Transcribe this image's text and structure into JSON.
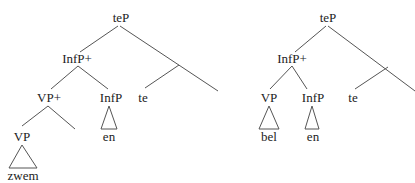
{
  "trees": [
    {
      "name": "left-tree",
      "nodes": {
        "root": "teP",
        "infp_plus": "InfP+",
        "vp_plus": "VP+",
        "infp": "InfP",
        "te": "te",
        "vp": "VP",
        "infp_leaf": "en",
        "vp_leaf": "zwem"
      }
    },
    {
      "name": "right-tree",
      "nodes": {
        "root": "teP",
        "infp_plus": "InfP+",
        "vp": "VP",
        "infp": "InfP",
        "te": "te",
        "vp_leaf": "bel",
        "infp_leaf": "en"
      }
    }
  ]
}
